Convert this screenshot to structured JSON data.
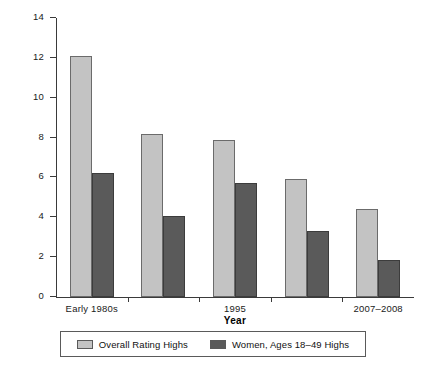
{
  "chart_data": {
    "type": "bar",
    "title": "",
    "subtitle": "",
    "xlabel": "Year",
    "ylabel": "Ratings",
    "categories": [
      "Early 1980s",
      "",
      "1995",
      "",
      "2007–2008"
    ],
    "xtick_labels": [
      "Early 1980s",
      "1995",
      "2007–2008"
    ],
    "series": [
      {
        "name": "Overall Rating Highs",
        "color": "#c3c3c3",
        "values": [
          12.1,
          8.2,
          7.9,
          5.9,
          4.4
        ]
      },
      {
        "name": "Women, Ages 18–49 Highs",
        "color": "#5a5a5a",
        "values": [
          6.2,
          4.05,
          5.7,
          3.3,
          1.85
        ]
      }
    ],
    "ylim": [
      0,
      14
    ],
    "yticks": [
      0,
      2,
      4,
      6,
      8,
      10,
      12,
      14
    ],
    "ytick_labels": [
      "0",
      "2",
      "4",
      "6",
      "8",
      "10",
      "12",
      "14"
    ],
    "grid": false,
    "legend_position": "bottom"
  },
  "legend": {
    "entries": [
      {
        "label": "Overall Rating Highs",
        "swatch": "light-gray-swatch"
      },
      {
        "label": "Women, Ages 18–49 Highs",
        "swatch": "dark-gray-swatch"
      }
    ]
  },
  "axes": {
    "y_title": "Ratings",
    "x_title": "Year"
  }
}
